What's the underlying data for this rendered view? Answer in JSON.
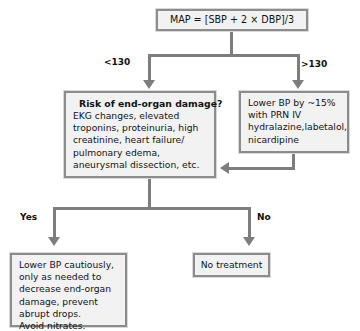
{
  "diagram": {
    "accent_border": "#8c8c8c",
    "node_fill": "#f2f2f2",
    "connector_color": "#7d7d7d",
    "nodes": {
      "map_formula": {
        "text": "MAP = [SBP + 2 × DBP]/3"
      },
      "risk": {
        "title": "Risk of end-organ damage?",
        "body": "EKG changes, elevated troponins, proteinuria, high creatinine, heart failure/ pulmonary edema, aneurysmal dissection, etc."
      },
      "lower_bp": {
        "body": "Lower BP by ~15% with PRN IV hydralazine,labetalol, nicardipine"
      },
      "cautious": {
        "body": "Lower BP cautiously, only as needed to decrease end-organ damage, prevent abrupt drops.\nAvoid nitrates."
      },
      "no_treatment": {
        "text": "No treatment"
      }
    },
    "edges": {
      "lt_130": "<130",
      "gt_130": ">130",
      "yes": "Yes",
      "no": "No"
    }
  }
}
